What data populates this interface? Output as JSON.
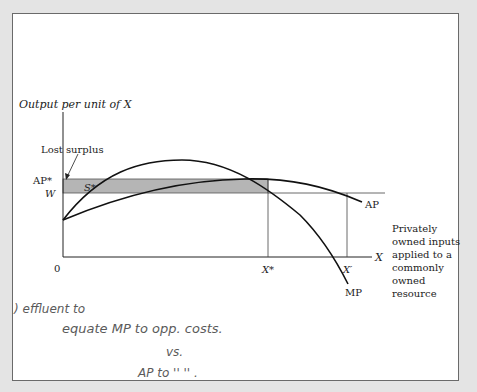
{
  "figure": {
    "y_axis_label": "Output per unit of X",
    "x_axis_label": "X",
    "origin_label": "0",
    "labels": {
      "ap_star": "AP*",
      "w": "W",
      "s_star": "S*",
      "lost_surplus": "Lost surplus",
      "x_star": "X*",
      "x_prime": "X′",
      "ap": "AP",
      "mp": "MP"
    },
    "caption_lines": [
      "Privately",
      "owned inputs",
      "applied to a",
      "commonly",
      "owned",
      "resource"
    ],
    "colors": {
      "frame_bg": "#e4e4e4",
      "page_bg": "#ffffff",
      "shade": "#b5b5b5",
      "ink": "#1a1a1a"
    }
  },
  "handwritten_notes": {
    "line1": ") effluent to",
    "line2": "equate  MP  to  opp.   costs.",
    "line3": "vs.",
    "line4": "AP to    ''    ''    ."
  }
}
